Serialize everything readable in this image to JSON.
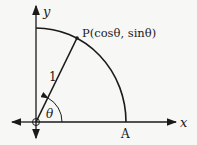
{
  "diagram": {
    "labels": {
      "y_axis": "y",
      "x_axis": "x",
      "point_p": "P(cosθ, sinθ)",
      "radius": "1",
      "angle": "θ",
      "point_a": "A"
    },
    "colors": {
      "ink": "#1a1a1a",
      "background": "#f7f7f5"
    }
  }
}
